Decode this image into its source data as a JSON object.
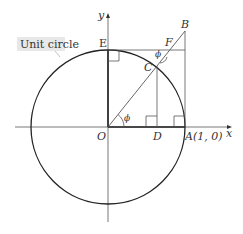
{
  "diagram": {
    "callout_label": "Unit circle",
    "axis_x_label": "x",
    "axis_y_label": "y",
    "points": {
      "O": "O",
      "A": "A(1, 0)",
      "B": "B",
      "C": "C",
      "D": "D",
      "E": "E",
      "F": "F"
    },
    "angle_at_O": "ϕ",
    "angle_at_F": "ϕ",
    "colors": {
      "circle": "#222222",
      "thin_lines": "#555555",
      "thick_lines": "#222222",
      "callout_bg": "#e8e8e8"
    }
  }
}
